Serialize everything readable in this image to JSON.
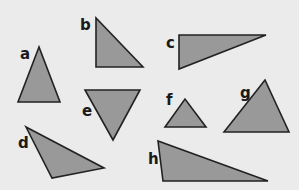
{
  "diagram": {
    "background": "#ebebeb",
    "fill_color": "#999999",
    "stroke_color": "#222222",
    "triangles": [
      {
        "label": "a",
        "points": "39,47 18,102 60,102",
        "label_pos": [
          20,
          59
        ]
      },
      {
        "label": "b",
        "points": "96,18 96,67 143,67",
        "label_pos": [
          80,
          30
        ]
      },
      {
        "label": "c",
        "points": "179,35 266,35 179,69",
        "label_pos": [
          166,
          48
        ]
      },
      {
        "label": "d",
        "points": "26,127 104,168 52,178",
        "label_pos": [
          18,
          148
        ]
      },
      {
        "label": "e",
        "points": "85,90 140,90 113,140",
        "label_pos": [
          82,
          116
        ]
      },
      {
        "label": "f",
        "points": "165,127 185,99 206,127",
        "label_pos": [
          166,
          105
        ]
      },
      {
        "label": "g",
        "points": "224,132 265,80 289,132",
        "label_pos": [
          240,
          98
        ]
      },
      {
        "label": "h",
        "points": "158,141 163,181 268,181",
        "label_pos": [
          148,
          164
        ]
      }
    ]
  }
}
